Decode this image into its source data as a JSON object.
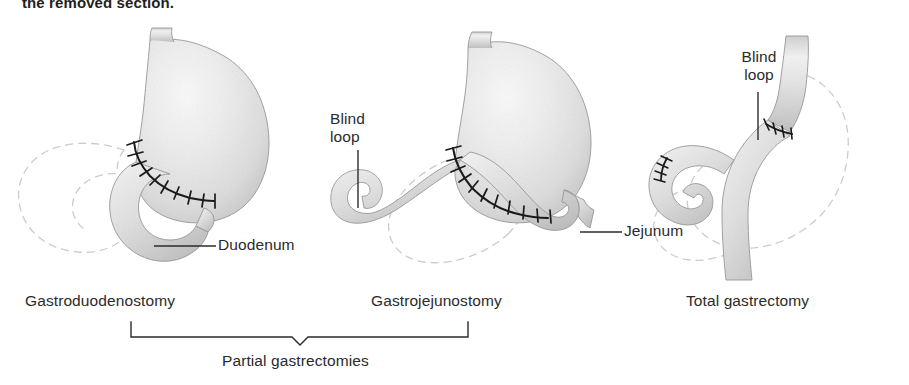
{
  "page": {
    "clipped_heading": "the removed section.",
    "background_color": "#ffffff",
    "ink_color": "#231f20",
    "organ_fill": "#e8e8e8",
    "dashed_outline_color": "#c8c8c8",
    "suture_color": "#1a1a1a"
  },
  "figures": [
    {
      "id": "gastroduodenostomy",
      "caption": "Gastroduodenostomy",
      "labels": [
        {
          "name": "duodenum",
          "text": "Duodenum",
          "leader": "horizontal"
        }
      ],
      "has_dashed_removed_outline": true,
      "has_suture_line": true,
      "organs": [
        "stomach-remnant",
        "duodenum"
      ]
    },
    {
      "id": "gastrojejunostomy",
      "caption": "Gastrojejunostomy",
      "labels": [
        {
          "name": "blind-loop",
          "text_line1": "Blind",
          "text_line2": "loop",
          "leader": "vertical"
        },
        {
          "name": "jejunum",
          "text": "Jejunum",
          "leader": "horizontal"
        }
      ],
      "has_dashed_removed_outline": true,
      "has_suture_line": true,
      "organs": [
        "stomach-remnant",
        "jejunum",
        "blind-loop"
      ]
    },
    {
      "id": "total-gastrectomy",
      "caption": "Total gastrectomy",
      "labels": [
        {
          "name": "blind-loop",
          "text_line1": "Blind",
          "text_line2": "loop",
          "leader": "vertical"
        }
      ],
      "has_dashed_removed_outline": true,
      "has_suture_line": true,
      "organs": [
        "esophagus",
        "jejunum",
        "blind-loop"
      ]
    }
  ],
  "bracket": {
    "label": "Partial gastrectomies",
    "spans_figures": [
      "gastroduodenostomy",
      "gastrojejunostomy"
    ]
  }
}
